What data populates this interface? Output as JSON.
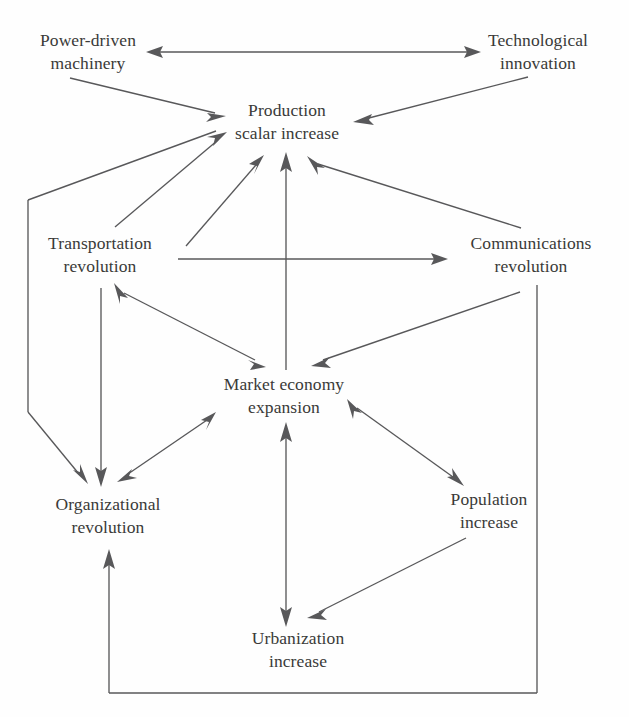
{
  "diagram": {
    "type": "directed-graph",
    "background_color": "#fefefe",
    "line_color": "#58585a",
    "text_color": "#3a3a38",
    "nodes": [
      {
        "id": "power",
        "line1": "Power-driven",
        "line2": "machinery",
        "x": 88,
        "y": 52
      },
      {
        "id": "technological",
        "line1": "Technological",
        "line2": "innovation",
        "x": 538,
        "y": 52
      },
      {
        "id": "production",
        "line1": "Production",
        "line2": "scalar increase",
        "x": 287,
        "y": 122
      },
      {
        "id": "transportation",
        "line1": "Transportation",
        "line2": "revolution",
        "x": 100,
        "y": 255
      },
      {
        "id": "communications",
        "line1": "Communications",
        "line2": "revolution",
        "x": 531,
        "y": 255
      },
      {
        "id": "market",
        "line1": "Market economy",
        "line2": "expansion",
        "x": 284,
        "y": 396
      },
      {
        "id": "organizational",
        "line1": "Organizational",
        "line2": "revolution",
        "x": 108,
        "y": 516
      },
      {
        "id": "population",
        "line1": "Population",
        "line2": "increase",
        "x": 489,
        "y": 511
      },
      {
        "id": "urbanization",
        "line1": "Urbanization",
        "line2": "increase",
        "x": 298,
        "y": 650
      }
    ],
    "edges": [
      {
        "id": "e-power-technological",
        "from": "power",
        "to": "technological",
        "direction": "both"
      },
      {
        "id": "e-power-production",
        "from": "power",
        "to": "production",
        "direction": "forward"
      },
      {
        "id": "e-technological-production",
        "from": "technological",
        "to": "production",
        "direction": "forward"
      },
      {
        "id": "e-production-transportation",
        "from": "production",
        "to": "transportation",
        "direction": "both"
      },
      {
        "id": "e-production-communications",
        "from": "communications",
        "to": "production",
        "direction": "forward"
      },
      {
        "id": "e-market-production",
        "from": "market",
        "to": "production",
        "direction": "forward"
      },
      {
        "id": "e-organizational-production",
        "from": "organizational",
        "to": "production",
        "direction": "forward"
      },
      {
        "id": "e-production-organizational-left",
        "from": "production",
        "to": "organizational",
        "direction": "forward"
      },
      {
        "id": "e-transportation-communications",
        "from": "transportation",
        "to": "communications",
        "direction": "forward"
      },
      {
        "id": "e-transportation-market",
        "from": "transportation",
        "to": "market",
        "direction": "both"
      },
      {
        "id": "e-communications-market",
        "from": "communications",
        "to": "market",
        "direction": "forward"
      },
      {
        "id": "e-transportation-organizational",
        "from": "transportation",
        "to": "organizational",
        "direction": "forward"
      },
      {
        "id": "e-market-organizational",
        "from": "market",
        "to": "organizational",
        "direction": "both"
      },
      {
        "id": "e-market-population",
        "from": "market",
        "to": "population",
        "direction": "both"
      },
      {
        "id": "e-market-urbanization",
        "from": "market",
        "to": "urbanization",
        "direction": "both"
      },
      {
        "id": "e-population-urbanization",
        "from": "population",
        "to": "urbanization",
        "direction": "forward"
      },
      {
        "id": "e-communications-organizational",
        "from": "communications",
        "to": "organizational",
        "direction": "forward"
      }
    ]
  }
}
